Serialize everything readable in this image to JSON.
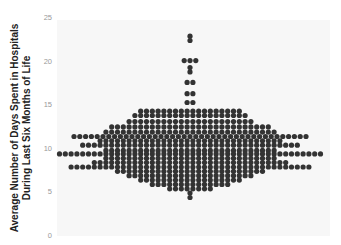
{
  "chart_data": {
    "type": "scatter",
    "subtype": "beeswarm",
    "title": "",
    "xlabel": "",
    "ylabel": [
      "Average Number of Days Spent in Hospitals",
      "During Last Six Months of Life"
    ],
    "ylim": [
      0,
      25
    ],
    "yticks": [
      0,
      5,
      10,
      15,
      20,
      25
    ],
    "grid": false,
    "legend": null,
    "dot_color": "#333333",
    "background_color": "#f7f7f7",
    "rows": [
      {
        "y": 22.8,
        "count": 1
      },
      {
        "y": 22.3,
        "count": 1
      },
      {
        "y": 20.0,
        "count": 3
      },
      {
        "y": 19.2,
        "count": 1
      },
      {
        "y": 18.7,
        "count": 1
      },
      {
        "y": 17.5,
        "count": 2
      },
      {
        "y": 16.2,
        "count": 2
      },
      {
        "y": 15.2,
        "count": 2
      },
      {
        "y": 14.2,
        "count": 18
      },
      {
        "y": 13.7,
        "count": 20
      },
      {
        "y": 13.0,
        "count": 22
      },
      {
        "y": 12.4,
        "count": 28
      },
      {
        "y": 11.8,
        "count": 30
      },
      {
        "y": 11.3,
        "count": 41
      },
      {
        "y": 10.8,
        "count": 32
      },
      {
        "y": 10.3,
        "count": 38
      },
      {
        "y": 9.7,
        "count": 30
      },
      {
        "y": 9.3,
        "count": 46
      },
      {
        "y": 8.8,
        "count": 30
      },
      {
        "y": 8.3,
        "count": 34
      },
      {
        "y": 7.8,
        "count": 42
      },
      {
        "y": 7.3,
        "count": 26
      },
      {
        "y": 6.8,
        "count": 22
      },
      {
        "y": 6.3,
        "count": 18
      },
      {
        "y": 5.8,
        "count": 14
      },
      {
        "y": 5.3,
        "count": 8
      },
      {
        "y": 4.8,
        "count": 1
      },
      {
        "y": 4.3,
        "count": 1
      }
    ]
  },
  "axis": {
    "ticks": [
      "25",
      "20",
      "15",
      "10",
      "5",
      "0"
    ]
  }
}
